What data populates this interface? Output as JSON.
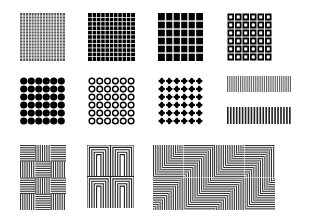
{
  "figure": {
    "background": "#ffffff",
    "ink": "#000000",
    "rows": [
      {
        "tiles": [
          {
            "name": "fine-grid-pattern",
            "kind": "grid",
            "x": 20,
            "y": 13,
            "w": 45,
            "h": 48,
            "cells": 16,
            "ink": "#555555"
          },
          {
            "name": "medium-grid-pattern",
            "kind": "grid",
            "x": 88,
            "y": 13,
            "w": 47,
            "h": 48,
            "cells": 11,
            "ink": "#000000"
          },
          {
            "name": "coarse-grid-pattern",
            "kind": "grid",
            "x": 158,
            "y": 13,
            "w": 45,
            "h": 48,
            "cells": 6,
            "ink": "#000000"
          },
          {
            "name": "square-ring-pattern",
            "kind": "square-rings",
            "x": 227,
            "y": 13,
            "w": 45,
            "h": 48,
            "cells": 6,
            "ink": "#000000"
          }
        ]
      },
      {
        "tiles": [
          {
            "name": "filled-dots-pattern",
            "kind": "dots",
            "x": 20,
            "y": 77,
            "w": 45,
            "h": 48,
            "cells": 6,
            "ink": "#000000"
          },
          {
            "name": "ring-dots-pattern",
            "kind": "rings",
            "x": 88,
            "y": 77,
            "w": 47,
            "h": 48,
            "cells": 6,
            "ink": "#000000"
          },
          {
            "name": "cross-dots-pattern",
            "kind": "crosses",
            "x": 158,
            "y": 77,
            "w": 45,
            "h": 48,
            "cells": 6,
            "ink": "#000000"
          },
          {
            "name": "fine-vertical-bars",
            "kind": "vbars",
            "x": 227,
            "y": 76,
            "w": 65,
            "h": 16,
            "count": 30,
            "ink": "#666666"
          },
          {
            "name": "coarse-vertical-bars",
            "kind": "vbars",
            "x": 227,
            "y": 107,
            "w": 65,
            "h": 17,
            "count": 22,
            "ink": "#222222"
          }
        ]
      },
      {
        "tiles": [
          {
            "name": "basketweave-line-pattern",
            "kind": "weave",
            "x": 20,
            "y": 145,
            "w": 46,
            "h": 65,
            "cols": 3,
            "rows": 4,
            "ink": "#333333"
          },
          {
            "name": "chevron-maze-pattern",
            "kind": "chevron",
            "x": 87,
            "y": 145,
            "w": 47,
            "h": 63,
            "cols": 2,
            "rows": 2,
            "ink": "#222222"
          },
          {
            "name": "triangle-line-pattern",
            "kind": "triangles",
            "x": 153,
            "y": 145,
            "w": 122,
            "h": 65,
            "cols": 4,
            "rows": 2,
            "ink": "#333333"
          }
        ]
      }
    ]
  }
}
